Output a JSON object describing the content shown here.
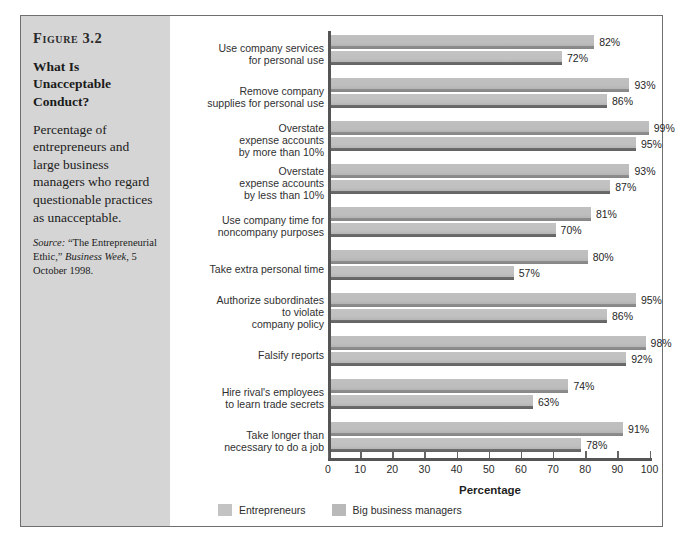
{
  "figure": {
    "number": "Figure 3.2",
    "title": "What Is Unacceptable Conduct?",
    "description": "Percentage of entrepreneurs and large business managers who regard questionable practices as unacceptable.",
    "source_label": "Source:",
    "source_text_1": "“The Entrepreneurial Ethic,”",
    "source_publication": "Business Week",
    "source_text_2": ", 5 October 1998."
  },
  "colors": {
    "panel_background": "#d5d5d5",
    "frame_border": "#6f6f6f",
    "bar_entrepreneurs": "#c0c0c0",
    "bar_big_business": "#bdbdbd",
    "bar_shadow_entrepreneurs": "#8e8e8e",
    "bar_shadow_big_business": "#6e6e6e",
    "axis": "#555555",
    "text": "#2b2b2b"
  },
  "chart_data": {
    "type": "bar",
    "orientation": "horizontal",
    "title": "What Is Unacceptable Conduct?",
    "xlabel": "Percentage",
    "ylabel": "",
    "xlim": [
      0,
      100
    ],
    "xticks": [
      0,
      10,
      20,
      30,
      40,
      50,
      60,
      70,
      80,
      90,
      100
    ],
    "xtick_labels": [
      "0",
      "10",
      "20",
      "30",
      "40",
      "50",
      "60",
      "70",
      "80",
      "90",
      "100"
    ],
    "grid": false,
    "legend_position": "bottom-left",
    "value_suffix": "%",
    "categories": [
      "Use company services for personal use",
      "Remove company supplies for personal use",
      "Overstate expense accounts by more than 10%",
      "Overstate expense accounts by less than 10%",
      "Use company time for noncompany purposes",
      "Take extra personal time",
      "Authorize subordinates to violate company policy",
      "Falsify reports",
      "Hire rival's employees to learn trade secrets",
      "Take longer than necessary to do a job"
    ],
    "category_lines": [
      [
        "Use company services",
        "for personal use"
      ],
      [
        "Remove company",
        "supplies for personal use"
      ],
      [
        "Overstate",
        "expense accounts",
        "by more than 10%"
      ],
      [
        "Overstate",
        "expense accounts",
        "by less than 10%"
      ],
      [
        "Use company time for",
        "noncompany purposes"
      ],
      [
        "Take extra personal time"
      ],
      [
        "Authorize subordinates",
        "to violate",
        "company policy"
      ],
      [
        "Falsify reports"
      ],
      [
        "Hire rival's employees",
        "to learn trade secrets"
      ],
      [
        "Take longer than",
        "necessary to do a job"
      ]
    ],
    "series": [
      {
        "name": "Entrepreneurs",
        "values": [
          82,
          93,
          99,
          93,
          81,
          80,
          95,
          98,
          74,
          91
        ],
        "labels": [
          "82%",
          "93%",
          "99%",
          "93%",
          "81%",
          "80%",
          "95%",
          "98%",
          "74%",
          "91%"
        ]
      },
      {
        "name": "Big business managers",
        "values": [
          72,
          86,
          95,
          87,
          70,
          57,
          86,
          92,
          63,
          78
        ],
        "labels": [
          "72%",
          "86%",
          "95%",
          "87%",
          "70%",
          "57%",
          "86%",
          "92%",
          "63%",
          "78%"
        ]
      }
    ]
  }
}
